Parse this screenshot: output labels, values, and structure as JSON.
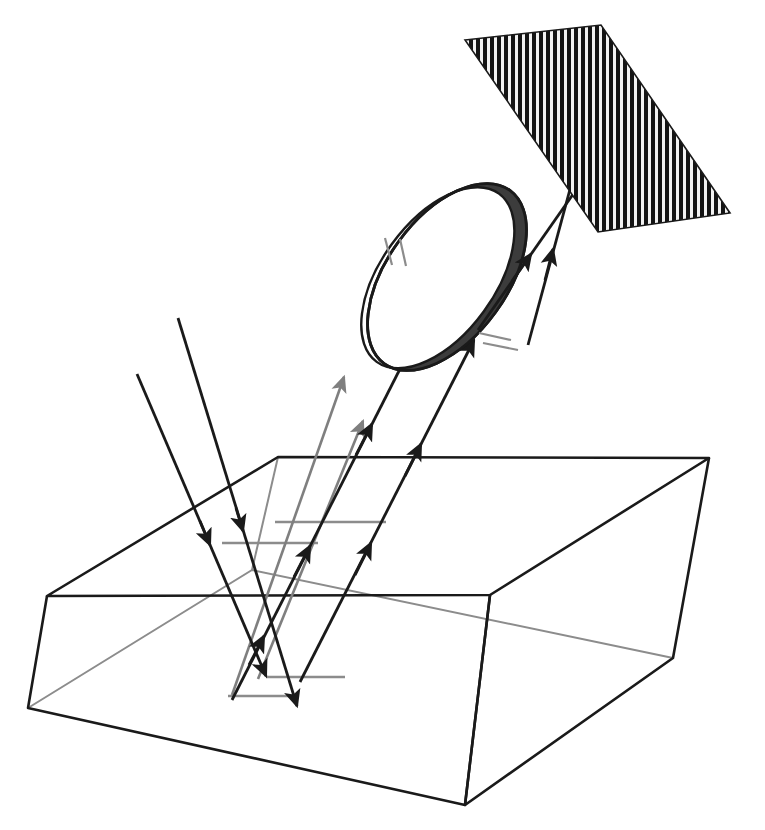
{
  "figure": {
    "background_color": "#ffffff",
    "width": 765,
    "height": 830
  },
  "colors": {
    "ray_primary": "#1a1a1a",
    "ray_secondary": "#7f7f7f",
    "outline": "#1a1a1a",
    "hidden_edge": "#8c8c8c",
    "lens_body_fill": "#ffffff",
    "lens_rim_fill": "#3c3c3c",
    "lens_rim_stroke": "#1a1a1a",
    "grating_stripe_dark": "#141414",
    "grating_stripe_light": "#f2f2f2",
    "grating_border": "#1a1a1a",
    "focal_mark": "#8c8c8c"
  },
  "components": {
    "grating": {
      "name": "striped detector array",
      "corners": [
        [
          465,
          40
        ],
        [
          601,
          25
        ],
        [
          730,
          213
        ],
        [
          598,
          232
        ]
      ],
      "stripe_count": 40,
      "stripe_orientation": "vertical",
      "stripe_width_px": 4,
      "stripe_gap_px": 3
    },
    "lens": {
      "name": "objective lens",
      "center": [
        447,
        277
      ],
      "radius_x": 107,
      "radius_y": 60,
      "rotation_deg": -54,
      "rim_thickness_px": 17,
      "tick_marks_upper_left": 2,
      "tick_marks_lower_right": 2
    },
    "specimen_block": {
      "name": "transparent sample block",
      "top_face": [
        [
          47,
          596
        ],
        [
          278,
          457
        ],
        [
          709,
          458
        ],
        [
          490,
          595
        ]
      ],
      "bottom_front": [
        [
          28,
          708
        ],
        [
          465,
          805
        ],
        [
          673,
          658
        ]
      ],
      "left_edge": [
        [
          47,
          596
        ],
        [
          28,
          708
        ]
      ],
      "front_edge": [
        [
          490,
          595
        ],
        [
          465,
          805
        ]
      ],
      "right_edge": [
        [
          709,
          458
        ],
        [
          673,
          658
        ]
      ],
      "hidden_back_edges": [
        [
          [
            28,
            708
          ],
          [
            252,
            570
          ],
          [
            673,
            658
          ]
        ],
        [
          [
            252,
            570
          ],
          [
            278,
            457
          ]
        ]
      ]
    }
  },
  "rays": {
    "incoming": [
      {
        "id": "in-1",
        "color": "#1a1a1a",
        "from": [
          178,
          318
        ],
        "to": [
          297,
          706
        ],
        "arrow_at": [
          240,
          523
        ],
        "label": "illumination ray 1"
      },
      {
        "id": "in-2",
        "color": "#1a1a1a",
        "from": [
          137,
          374
        ],
        "to": [
          266,
          676
        ],
        "arrow_at": [
          215,
          551
        ],
        "label": "illumination ray 2"
      }
    ],
    "outgoing_gray": [
      {
        "id": "out-g1",
        "color": "#7f7f7f",
        "from": [
          232,
          695
        ],
        "to": [
          344,
          377
        ],
        "label": "scattered ray 1"
      },
      {
        "id": "out-g2",
        "color": "#7f7f7f",
        "from": [
          258,
          679
        ],
        "to": [
          363,
          421
        ],
        "label": "scattered ray 2"
      }
    ],
    "to_lens": [
      {
        "id": "lens-1",
        "color": "#1a1a1a",
        "from": [
          232,
          696
        ],
        "to": [
          436,
          300
        ],
        "label": "collected ray 1"
      },
      {
        "id": "lens-2",
        "color": "#1a1a1a",
        "from": [
          300,
          676
        ],
        "to": [
          473,
          342
        ],
        "label": "collected ray 2"
      }
    ],
    "to_grating": [
      {
        "id": "grat-1",
        "color": "#1a1a1a",
        "from": [
          490,
          332
        ],
        "to": [
          601,
          148
        ],
        "label": "focused ray 1"
      },
      {
        "id": "grat-2",
        "color": "#1a1a1a",
        "from": [
          524,
          341
        ],
        "to": [
          585,
          131
        ],
        "label": "focused ray 2"
      }
    ]
  },
  "focal_marks": [
    {
      "id": "fm-1",
      "x1": 228,
      "x2": 293,
      "y": 696,
      "color": "#8c8c8c",
      "label": "focal plane mark lower-left"
    },
    {
      "id": "fm-2",
      "x1": 266,
      "x2": 345,
      "y": 677,
      "color": "#8c8c8c",
      "label": "focal plane mark lower-right"
    },
    {
      "id": "fm-3",
      "x1": 222,
      "x2": 318,
      "y": 543,
      "color": "#8c8c8c",
      "label": "focal plane mark upper-left"
    },
    {
      "id": "fm-4",
      "x1": 275,
      "x2": 386,
      "y": 522,
      "color": "#8c8c8c",
      "label": "focal plane mark upper-right"
    }
  ]
}
